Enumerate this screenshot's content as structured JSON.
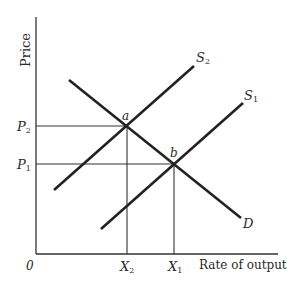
{
  "diagram": {
    "type": "supply-demand",
    "y_axis_label": "Price",
    "x_axis_label": "Rate of output",
    "origin_label": "0",
    "price_levels": [
      {
        "id": "P2",
        "main": "P",
        "sub": "2"
      },
      {
        "id": "P1",
        "main": "P",
        "sub": "1"
      }
    ],
    "quantity_levels": [
      {
        "id": "X2",
        "main": "X",
        "sub": "2"
      },
      {
        "id": "X1",
        "main": "X",
        "sub": "1"
      }
    ],
    "curves": [
      {
        "id": "S2",
        "main": "S",
        "sub": "2",
        "kind": "supply"
      },
      {
        "id": "S1",
        "main": "S",
        "sub": "1",
        "kind": "supply"
      },
      {
        "id": "D",
        "main": "D",
        "sub": "",
        "kind": "demand"
      }
    ],
    "points": [
      {
        "id": "a",
        "label": "a",
        "price": "P2",
        "quantity": "X2",
        "curves": [
          "S2",
          "D"
        ]
      },
      {
        "id": "b",
        "label": "b",
        "price": "P1",
        "quantity": "X1",
        "curves": [
          "S1",
          "D"
        ]
      }
    ]
  }
}
